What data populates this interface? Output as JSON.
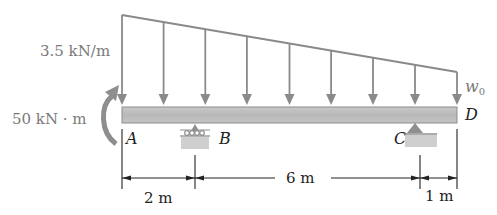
{
  "diagram": {
    "type": "beam-loading",
    "load": {
      "left_intensity_label": "3.5 kN/m",
      "right_intensity_label": "w",
      "right_intensity_sub": "0",
      "arrow_count": 9
    },
    "moment": {
      "label": "50 kN · m",
      "direction": "counterclockwise"
    },
    "points": {
      "A": "A",
      "B": "B",
      "C": "C",
      "D": "D"
    },
    "supports": [
      {
        "point": "B",
        "type": "roller"
      },
      {
        "point": "C",
        "type": "pin"
      }
    ],
    "dimensions": [
      {
        "from": "A",
        "to": "B",
        "label": "2 m"
      },
      {
        "from": "B",
        "to": "C",
        "label": "6 m"
      },
      {
        "from": "C",
        "to": "D",
        "label": "1 m"
      }
    ],
    "colors": {
      "load": "#8a8a8a",
      "beam_fill": "#bdbdbd",
      "beam_stroke": "#8c8c8c",
      "support": "#8f8f8f",
      "ground": "#c9c9c9",
      "moment_arrow": "#8e8e8e",
      "dim_line": "#222222"
    }
  }
}
